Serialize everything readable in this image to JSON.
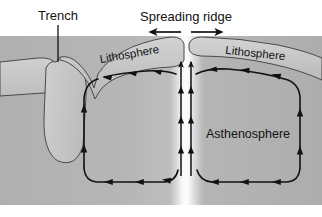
{
  "figure": {
    "width": 322,
    "height": 217,
    "background_color": "#ffffff"
  },
  "labels": {
    "trench": "Trench",
    "spreading_ridge": "Spreading ridge",
    "lithosphere_left": "Lithosphere",
    "lithosphere_right": "Lithosphere",
    "asthenosphere": "Asthenosphere"
  },
  "colors": {
    "mantle_fill": "#b4b4b4",
    "mantle_fill_light": "#c9c9c9",
    "ridge_band_light": "#f4f4f4",
    "lithosphere_fill": "#c6c6c6",
    "slab_fill": "#c2c2c2",
    "outline": "#3a3a3a",
    "arrow": "#121212",
    "text": "#121212"
  },
  "annotations": {
    "trench_leader_line": "vertical leader from Trench label down to trench notch",
    "spreading_arrows": [
      {
        "name": "spreading-arrow-left",
        "direction": "left"
      },
      {
        "name": "spreading-arrow-right",
        "direction": "right"
      }
    ]
  },
  "convection": {
    "upwelling": {
      "label": "ridge upwelling",
      "direction": "up",
      "columns": 2,
      "arrowheads_per_column": 4
    },
    "left_cell": {
      "label": "left convection cell",
      "rotation": "counterclockwise",
      "top_flow": "left",
      "bottom_flow": "right",
      "descending_side": "left",
      "ascending_side": "right"
    },
    "right_cell": {
      "label": "right convection cell",
      "rotation": "clockwise",
      "top_flow": "right",
      "bottom_flow": "left",
      "descending_side": "right",
      "ascending_side": "left"
    }
  },
  "features": {
    "subducting_slab": "Subducting lithospheric slab descending at the trench",
    "ridge_axis_x": 186
  }
}
